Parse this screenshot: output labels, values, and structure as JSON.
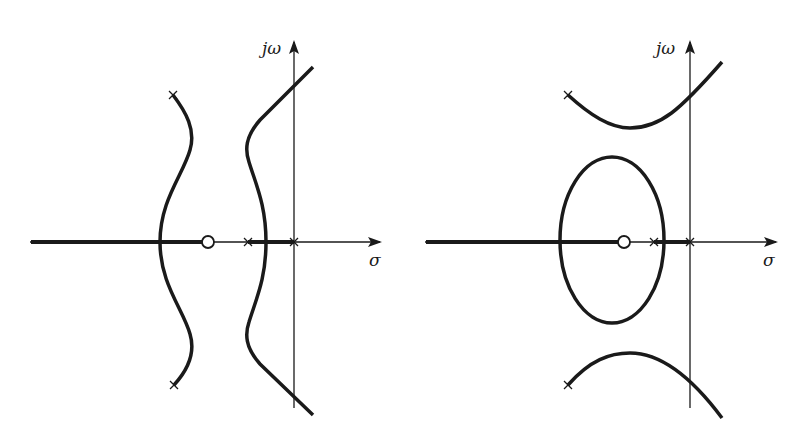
{
  "colors": {
    "stroke": "#1a1a1a",
    "background": "#ffffff"
  },
  "left_plot": {
    "y_axis_label": "jω",
    "x_axis_label": "σ",
    "poles": [
      "(0,0)",
      "real pole left of origin",
      "complex pair upper-left",
      "complex pair lower-left"
    ],
    "zeros": [
      "real zero left of poles"
    ]
  },
  "right_plot": {
    "y_axis_label": "jω",
    "x_axis_label": "σ",
    "poles": [
      "(0,0)",
      "real pole left of origin",
      "complex pair upper-left",
      "complex pair lower-left"
    ],
    "zeros": [
      "real zero left of poles"
    ]
  }
}
